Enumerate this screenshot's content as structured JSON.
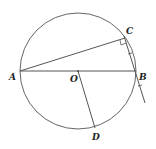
{
  "diagram": {
    "type": "geometry",
    "circle": {
      "center_label": "O",
      "cx": 78,
      "cy": 71,
      "r": 58
    },
    "points": [
      {
        "label": "A",
        "x": 20,
        "y": 71,
        "lx": 9,
        "ly": 80
      },
      {
        "label": "B",
        "x": 136,
        "y": 71,
        "lx": 139,
        "ly": 80
      },
      {
        "label": "C",
        "x": 125,
        "y": 38,
        "lx": 126,
        "ly": 34
      },
      {
        "label": "O",
        "x": 78,
        "y": 71,
        "lx": 70,
        "ly": 82
      },
      {
        "label": "D",
        "x": 95,
        "y": 128,
        "lx": 92,
        "ly": 140
      }
    ],
    "segments": [
      "AB",
      "AC",
      "OD",
      "C-tangent-line"
    ],
    "right_angle_at": "C",
    "stroke_color": "#555555"
  },
  "labels": {
    "A": "A",
    "B": "B",
    "C": "C",
    "O": "O",
    "D": "D"
  }
}
